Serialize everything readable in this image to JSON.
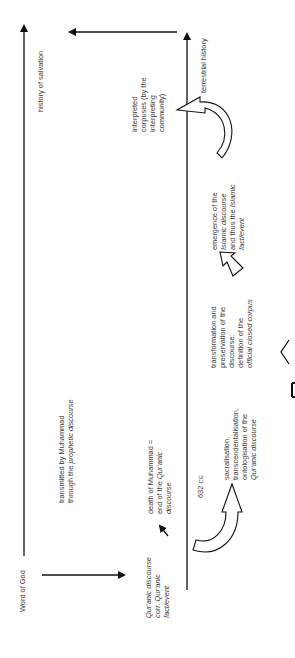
{
  "diagram": {
    "orientation": "rotated 90deg counter-clockwise",
    "axes": {
      "left_axis_label": "history of salvation",
      "right_axis_label": "terrestrial history",
      "source_label": "Word of God"
    },
    "labels": {
      "transmitted_line1": "transmitted by Muhammad",
      "transmitted_line2_prefix": "through the ",
      "transmitted_line2_italic": "prophetic discourse",
      "quranic_line1": "Qur'anic discourse",
      "quranic_line2": "corr. Qur'anic",
      "quranic_line3": "fact/event",
      "death_line1": "death of Muhammad =",
      "death_line2_prefix": "end of the ",
      "death_line2_italic": "Qur'anic",
      "death_line3": "discourse",
      "date_number": "632",
      "date_era": "CE",
      "sacral_line1": "sacralisation,",
      "sacral_line2": "transcendentalisation,",
      "sacral_line3": "ontologisation of the",
      "sacral_line4": "Qur'anic discourse",
      "transform_line1": "transformation and",
      "transform_line2": "preservation of the",
      "transform_line3": "discourse:",
      "transform_line4": "definition of the",
      "transform_line5": "official closed corpus",
      "emergence_line1": "emergence of the",
      "emergence_line2_italic": "Islamic discourse",
      "emergence_line3_prefix": "and thus the ",
      "emergence_line3_italic": "Islamic",
      "emergence_line4": "fact/event",
      "interpreted_line1": "interpreted",
      "interpreted_line2": "corpuses (by the",
      "interpreted_line3": "interpreting",
      "interpreted_line4": "community)"
    },
    "colors": {
      "line": "#111111",
      "text": "#3a3a3a",
      "background": "#ffffff"
    }
  }
}
